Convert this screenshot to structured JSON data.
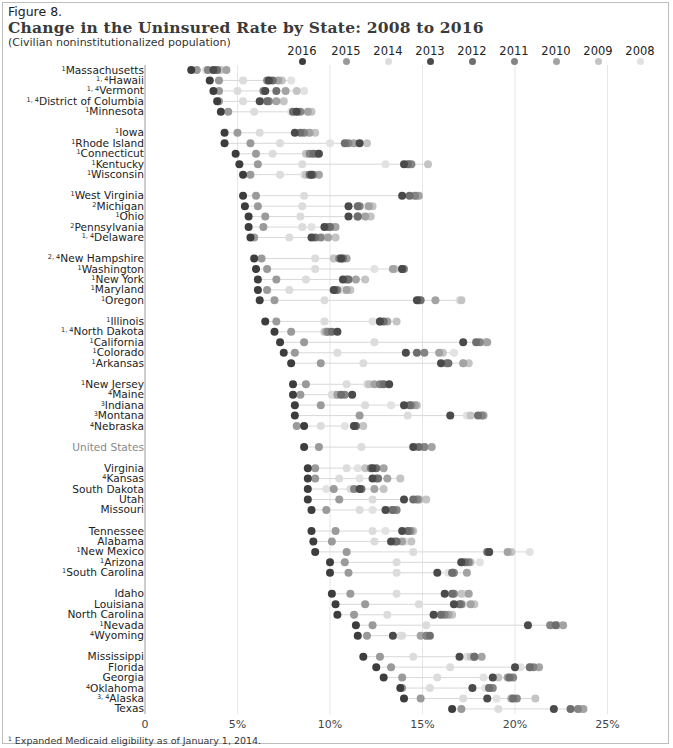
{
  "figure": {
    "label": "Figure 8.",
    "title": "Change in the Uninsured Rate by State: 2008 to 2016",
    "subtitle": "(Civilian noninstitutionalized population)",
    "footnote_marker": "1",
    "footnote": "Expanded Medicaid eligibility as of January 1, 2014."
  },
  "legend": [
    {
      "year": "2016",
      "color": "#3d3d3d"
    },
    {
      "year": "2015",
      "color": "#9a9a9a"
    },
    {
      "year": "2014",
      "color": "#dcdcdc"
    },
    {
      "year": "2013",
      "color": "#4a4a4a"
    },
    {
      "year": "2012",
      "color": "#6e6e6e"
    },
    {
      "year": "2011",
      "color": "#858585"
    },
    {
      "year": "2010",
      "color": "#a3a3a3"
    },
    {
      "year": "2009",
      "color": "#c4c4c4"
    },
    {
      "year": "2008",
      "color": "#e2e2e2"
    }
  ],
  "axis": {
    "ticks": [
      "0",
      "5%",
      "10%",
      "15%",
      "20%",
      "25%"
    ],
    "tick_values": [
      0,
      5,
      10,
      15,
      20,
      25
    ]
  },
  "chart_data": {
    "type": "scatter",
    "title": "Change in the Uninsured Rate by State: 2008 to 2016",
    "subtitle": "(Civilian noninstitutionalized population)",
    "xlabel": "Uninsured rate (%)",
    "ylabel": "",
    "xlim": [
      0,
      27
    ],
    "grid": true,
    "legend_position": "top",
    "series_years": [
      "2016",
      "2015",
      "2014",
      "2013",
      "2012",
      "2011",
      "2010",
      "2009",
      "2008"
    ],
    "rows": [
      {
        "state": "Massachusetts",
        "sup": "1",
        "group": 0,
        "values": [
          2.5,
          2.8,
          3.3,
          3.7,
          3.9,
          3.4,
          4.4,
          4.1,
          3.9
        ]
      },
      {
        "state": "Hawaii",
        "sup": "1, 4",
        "group": 0,
        "values": [
          3.5,
          4.0,
          5.3,
          6.7,
          6.9,
          6.6,
          7.2,
          7.4,
          7.9
        ]
      },
      {
        "state": "Vermont",
        "sup": "1, 4",
        "group": 0,
        "values": [
          3.7,
          4.0,
          5.0,
          6.5,
          7.1,
          6.4,
          7.6,
          8.2,
          8.6
        ]
      },
      {
        "state": "District of Columbia",
        "sup": "1, 4",
        "group": 0,
        "values": [
          3.9,
          4.0,
          5.3,
          6.2,
          6.6,
          6.7,
          7.1,
          7.5,
          6.3
        ]
      },
      {
        "state": "Minnesota",
        "sup": "1",
        "group": 0,
        "values": [
          4.1,
          4.5,
          5.9,
          8.2,
          8.0,
          8.4,
          8.8,
          9.0,
          7.9
        ]
      },
      {
        "state": "Iowa",
        "sup": "1",
        "group": 1,
        "values": [
          4.3,
          5.0,
          6.2,
          8.1,
          8.4,
          8.6,
          8.9,
          9.2,
          8.8
        ]
      },
      {
        "state": "Rhode Island",
        "sup": "1",
        "group": 1,
        "values": [
          4.3,
          5.7,
          7.3,
          11.6,
          10.8,
          11.0,
          11.3,
          12.0,
          10.0
        ]
      },
      {
        "state": "Connecticut",
        "sup": "1",
        "group": 1,
        "values": [
          4.9,
          6.0,
          6.9,
          9.4,
          9.1,
          8.9,
          9.3,
          8.7,
          8.8
        ]
      },
      {
        "state": "Kentucky",
        "sup": "1",
        "group": 1,
        "values": [
          5.1,
          6.1,
          8.5,
          14.0,
          14.2,
          14.4,
          14.3,
          15.3,
          13.0
        ]
      },
      {
        "state": "Wisconsin",
        "sup": "1",
        "group": 1,
        "values": [
          5.3,
          5.7,
          7.3,
          9.0,
          8.9,
          9.1,
          9.4,
          8.7,
          8.6
        ]
      },
      {
        "state": "West Virginia",
        "sup": "1",
        "group": 2,
        "values": [
          5.3,
          6.0,
          8.6,
          13.9,
          14.3,
          14.6,
          14.8,
          14.7,
          14.5
        ]
      },
      {
        "state": "Michigan",
        "sup": "2",
        "group": 2,
        "values": [
          5.4,
          6.1,
          8.5,
          11.0,
          11.5,
          11.6,
          12.1,
          12.3,
          12.0
        ]
      },
      {
        "state": "Ohio",
        "sup": "1",
        "group": 2,
        "values": [
          5.6,
          6.5,
          8.4,
          11.0,
          11.5,
          11.5,
          11.9,
          12.2,
          12.0
        ]
      },
      {
        "state": "Pennsylvania",
        "sup": "2",
        "group": 2,
        "values": [
          5.6,
          6.4,
          8.5,
          9.7,
          10.0,
          9.9,
          10.3,
          10.2,
          9.0
        ]
      },
      {
        "state": "Delaware",
        "sup": "1, 4",
        "group": 2,
        "values": [
          5.7,
          5.9,
          7.8,
          9.0,
          9.2,
          9.5,
          9.9,
          10.3,
          9.7
        ]
      },
      {
        "state": "New Hampshire",
        "sup": "2, 4",
        "group": 3,
        "values": [
          5.9,
          6.3,
          9.2,
          10.6,
          10.7,
          10.5,
          10.9,
          10.2,
          10.2
        ]
      },
      {
        "state": "Washington",
        "sup": "1",
        "group": 3,
        "values": [
          6.0,
          6.6,
          9.2,
          13.9,
          13.9,
          14.0,
          13.4,
          13.5,
          12.4
        ]
      },
      {
        "state": "New York",
        "sup": "1",
        "group": 3,
        "values": [
          6.1,
          7.1,
          8.7,
          10.7,
          11.0,
          10.9,
          11.4,
          11.9,
          10.9
        ]
      },
      {
        "state": "Maryland",
        "sup": "1",
        "group": 3,
        "values": [
          6.1,
          6.6,
          7.8,
          10.2,
          10.3,
          10.4,
          10.9,
          11.1,
          10.7
        ]
      },
      {
        "state": "Oregon",
        "sup": "1",
        "group": 3,
        "values": [
          6.2,
          7.0,
          9.7,
          14.7,
          14.9,
          14.8,
          15.7,
          17.1,
          17.0
        ]
      },
      {
        "state": "Illinois",
        "sup": "1",
        "group": 4,
        "values": [
          6.5,
          7.1,
          9.7,
          12.7,
          12.9,
          12.7,
          13.1,
          13.6,
          12.3
        ]
      },
      {
        "state": "North Dakota",
        "sup": "1, 4",
        "group": 4,
        "values": [
          7.0,
          7.9,
          9.8,
          10.4,
          10.1,
          9.9,
          9.8,
          9.7,
          9.8
        ]
      },
      {
        "state": "California",
        "sup": "1",
        "group": 4,
        "values": [
          7.3,
          8.6,
          12.4,
          17.2,
          17.9,
          18.1,
          18.5,
          18.4,
          18.0
        ]
      },
      {
        "state": "Colorado",
        "sup": "1",
        "group": 4,
        "values": [
          7.5,
          8.1,
          10.4,
          14.1,
          14.7,
          15.1,
          15.9,
          16.1,
          16.7
        ]
      },
      {
        "state": "Arkansas",
        "sup": "1",
        "group": 4,
        "values": [
          7.9,
          9.5,
          11.8,
          16.0,
          16.4,
          16.3,
          17.2,
          17.5,
          17.2
        ]
      },
      {
        "state": "New Jersey",
        "sup": "1",
        "group": 5,
        "values": [
          8.0,
          8.7,
          10.9,
          13.2,
          12.9,
          12.7,
          12.4,
          12.1,
          12.0
        ]
      },
      {
        "state": "Maine",
        "sup": "4",
        "group": 5,
        "values": [
          8.0,
          8.4,
          10.1,
          11.2,
          10.6,
          10.8,
          10.4,
          10.3,
          10.1
        ]
      },
      {
        "state": "Indiana",
        "sup": "3",
        "group": 5,
        "values": [
          8.1,
          9.5,
          11.9,
          14.0,
          14.3,
          14.4,
          14.6,
          14.7,
          13.3
        ]
      },
      {
        "state": "Montana",
        "sup": "3",
        "group": 5,
        "values": [
          8.1,
          11.6,
          14.2,
          16.5,
          18.0,
          18.2,
          18.3,
          17.6,
          17.4
        ]
      },
      {
        "state": "Nebraska",
        "sup": "4",
        "group": 5,
        "values": [
          8.6,
          8.2,
          9.5,
          11.3,
          11.4,
          11.4,
          11.3,
          11.8,
          10.8
        ]
      },
      {
        "state": "United States",
        "sup": "",
        "group": 6,
        "us": true,
        "values": [
          8.6,
          9.4,
          11.7,
          14.5,
          14.8,
          15.1,
          15.5,
          15.1,
          14.6
        ]
      },
      {
        "state": "Virginia",
        "sup": "",
        "group": 7,
        "values": [
          8.8,
          9.2,
          10.9,
          12.3,
          12.5,
          12.2,
          12.9,
          11.9,
          11.5
        ]
      },
      {
        "state": "Kansas",
        "sup": "4",
        "group": 7,
        "values": [
          8.8,
          9.2,
          10.5,
          12.3,
          12.6,
          12.5,
          13.1,
          13.8,
          11.6
        ]
      },
      {
        "state": "South Dakota",
        "sup": "",
        "group": 7,
        "values": [
          8.8,
          10.2,
          11.1,
          11.6,
          11.7,
          11.3,
          12.4,
          12.9,
          9.8
        ]
      },
      {
        "state": "Utah",
        "sup": "",
        "group": 7,
        "values": [
          8.8,
          10.5,
          12.3,
          14.0,
          14.5,
          14.7,
          14.8,
          15.2,
          14.9
        ]
      },
      {
        "state": "Missouri",
        "sup": "",
        "group": 7,
        "values": [
          9.0,
          9.8,
          11.6,
          13.0,
          13.4,
          13.6,
          13.4,
          13.2,
          12.3
        ]
      },
      {
        "state": "Tennessee",
        "sup": "",
        "group": 8,
        "values": [
          9.0,
          10.3,
          12.3,
          13.9,
          14.2,
          14.3,
          14.4,
          14.5,
          13.0
        ]
      },
      {
        "state": "Alabama",
        "sup": "",
        "group": 8,
        "values": [
          9.1,
          10.1,
          12.4,
          13.3,
          13.6,
          13.5,
          13.9,
          14.4,
          14.1
        ]
      },
      {
        "state": "New Mexico",
        "sup": "1",
        "group": 8,
        "values": [
          9.2,
          10.9,
          14.5,
          18.6,
          18.5,
          18.6,
          19.6,
          19.8,
          20.8
        ]
      },
      {
        "state": "Arizona",
        "sup": "1",
        "group": 8,
        "values": [
          10.0,
          10.8,
          13.6,
          17.1,
          17.3,
          17.5,
          17.1,
          17.6,
          18.1
        ]
      },
      {
        "state": "South Carolina",
        "sup": "1",
        "group": 8,
        "values": [
          10.0,
          11.0,
          13.6,
          15.8,
          16.6,
          16.7,
          17.4,
          16.6,
          16.4
        ]
      },
      {
        "state": "Idaho",
        "sup": "",
        "group": 9,
        "values": [
          10.1,
          11.1,
          13.6,
          16.2,
          16.6,
          16.7,
          17.5,
          17.1,
          17.3
        ]
      },
      {
        "state": "Louisiana",
        "sup": "",
        "group": 9,
        "values": [
          10.3,
          11.9,
          14.8,
          16.7,
          17.0,
          17.1,
          17.6,
          17.8,
          17.2
        ]
      },
      {
        "state": "North Carolina",
        "sup": "",
        "group": 9,
        "values": [
          10.4,
          11.3,
          13.1,
          15.6,
          16.0,
          16.2,
          16.4,
          16.6,
          15.9
        ]
      },
      {
        "state": "Nevada",
        "sup": "1",
        "group": 9,
        "values": [
          11.4,
          12.3,
          15.2,
          20.7,
          22.2,
          21.9,
          22.6,
          22.3,
          22.0
        ]
      },
      {
        "state": "Wyoming",
        "sup": "4",
        "group": 9,
        "values": [
          11.5,
          12.0,
          13.9,
          13.4,
          15.4,
          15.2,
          14.9,
          15.2,
          13.8
        ]
      },
      {
        "state": "Mississippi",
        "sup": "",
        "group": 10,
        "values": [
          11.8,
          12.7,
          14.5,
          17.0,
          17.8,
          17.8,
          18.2,
          17.6,
          17.4
        ]
      },
      {
        "state": "Florida",
        "sup": "",
        "group": 10,
        "values": [
          12.5,
          13.3,
          16.5,
          20.0,
          20.8,
          21.0,
          21.3,
          20.8,
          20.3
        ]
      },
      {
        "state": "Georgia",
        "sup": "",
        "group": 10,
        "values": [
          12.9,
          13.9,
          15.8,
          18.8,
          19.7,
          19.9,
          19.6,
          19.1,
          18.3
        ]
      },
      {
        "state": "Oklahoma",
        "sup": "4",
        "group": 10,
        "values": [
          13.8,
          13.9,
          15.4,
          17.7,
          18.6,
          18.8,
          18.6,
          18.7,
          18.4
        ]
      },
      {
        "state": "Alaska",
        "sup": "3, 4",
        "group": 10,
        "values": [
          14.0,
          14.9,
          17.2,
          18.5,
          19.9,
          20.1,
          19.8,
          21.1,
          19.0
        ]
      },
      {
        "state": "Texas",
        "sup": "",
        "group": 10,
        "values": [
          16.6,
          17.1,
          19.1,
          22.1,
          23.0,
          23.4,
          23.7,
          23.5,
          23.6
        ]
      }
    ]
  }
}
